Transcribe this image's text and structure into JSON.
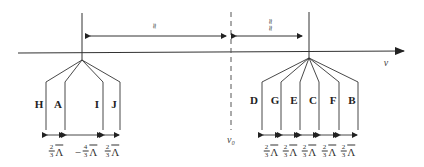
{
  "diagram": {
    "axis": {
      "label": "ν",
      "color": "#333333"
    },
    "reference": {
      "label": "ν₀"
    },
    "top_spans": [
      {
        "label": "≈",
        "direction": "left-to-right-double"
      },
      {
        "label": "≈≈",
        "direction": "double"
      }
    ],
    "left_group": {
      "lines": [
        "H",
        "A",
        "I",
        "J"
      ],
      "spacings": [
        {
          "num": "2",
          "den": "3",
          "sym": "Λ",
          "prefix": ""
        },
        {
          "num": "4",
          "den": "3",
          "sym": "Λ",
          "prefix": "Λ −"
        },
        {
          "num": "2",
          "den": "3",
          "sym": "Λ",
          "prefix": ""
        }
      ]
    },
    "right_group": {
      "lines": [
        "D",
        "G",
        "E",
        "C",
        "F",
        "B"
      ],
      "spacings": [
        {
          "num": "2",
          "den": "3",
          "sym": "Λ"
        },
        {
          "num": "2",
          "den": "3",
          "sym": "Λ"
        },
        {
          "num": "2",
          "den": "3",
          "sym": "Λ"
        },
        {
          "num": "2",
          "den": "3",
          "sym": "Λ"
        },
        {
          "num": "2",
          "den": "3",
          "sym": "Λ"
        }
      ]
    }
  }
}
